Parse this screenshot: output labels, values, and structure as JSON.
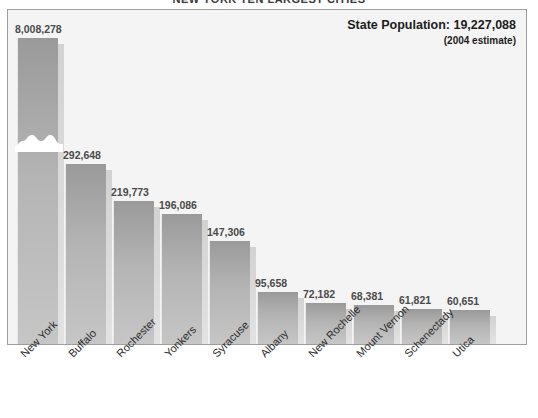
{
  "title": "NEW YORK  TEN LARGEST CITIES",
  "annotation": {
    "state_population_label": "State Population: 19,227,088",
    "estimate_note": "(2004 estimate)"
  },
  "chart_data": {
    "type": "bar",
    "title": "NEW YORK  TEN LARGEST CITIES",
    "xlabel": "",
    "ylabel": "",
    "grid": false,
    "legend": "none",
    "axis_note": "Value axis is broken; the New York bar is truncated with a break symbol.",
    "categories": [
      "New York",
      "Buffalo",
      "Rochester",
      "Yonkers",
      "Syracuse",
      "Albany",
      "New Rochelle",
      "Mount Vernon",
      "Schenectady",
      "Utica"
    ],
    "values": [
      8008278,
      292648,
      219773,
      196086,
      147306,
      95658,
      72182,
      68381,
      61821,
      60651
    ],
    "value_labels": [
      "8,008,278",
      "292,648",
      "219,773",
      "196,086",
      "147,306",
      "95,658",
      "72,182",
      "68,381",
      "61,821",
      "60,651"
    ],
    "bar_pixel_heights": [
      306,
      180,
      143,
      130,
      103,
      52,
      41,
      39,
      35,
      34
    ],
    "broken_bar_index": 0,
    "colors": {
      "bar_top": "#9a9a9a",
      "bar_bottom": "#c6c6c6",
      "bar_shadow": "#dcdcdc",
      "plot_background": "#f4f4f4",
      "frame_border": "#9e9e9e",
      "label_text": "#4a4a4a",
      "annotation_text": "#1c1c1c"
    }
  }
}
